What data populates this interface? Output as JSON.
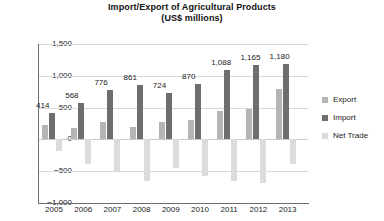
{
  "chart_data": {
    "type": "bar",
    "title": "Import/Export of Agricultural Products",
    "subtitle": "(US$ millions)",
    "xlabel": "",
    "ylabel": "",
    "ylim": [
      -1000,
      1500
    ],
    "ytick_step": 500,
    "grid": true,
    "legend_position": "right",
    "categories": [
      "2005",
      "2006",
      "2007",
      "2008",
      "2009",
      "2010",
      "2011",
      "2012",
      "2013"
    ],
    "series": [
      {
        "name": "Export",
        "color": "#b5b5b5",
        "values": [
          230,
          175,
          280,
          200,
          270,
          300,
          440,
          480,
          790
        ]
      },
      {
        "name": "Import",
        "color": "#6e6e6e",
        "values": [
          414,
          568,
          776,
          861,
          724,
          870,
          1088,
          1165,
          1180
        ],
        "labels": [
          "414",
          "568",
          "776",
          "861",
          "724",
          "870",
          "1,088",
          "1,165",
          "1,180"
        ]
      },
      {
        "name": "Net Trade",
        "color": "#dcdcdc",
        "values": [
          -184,
          -393,
          -496,
          -661,
          -454,
          -570,
          -648,
          -685,
          -390
        ]
      }
    ],
    "ytick_labels": [
      "1,500",
      "1,000",
      "500",
      "0",
      "−500",
      "−1,000"
    ],
    "ytick_values": [
      1500,
      1000,
      500,
      0,
      -500,
      -1000
    ]
  },
  "legend": {
    "items": [
      {
        "label": "Export",
        "color": "#b5b5b5"
      },
      {
        "label": "Import",
        "color": "#6e6e6e"
      },
      {
        "label": "Net Trade",
        "color": "#dcdcdc"
      }
    ]
  }
}
